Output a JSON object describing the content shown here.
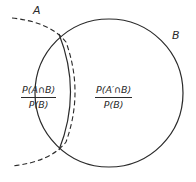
{
  "diagram": {
    "type": "venn",
    "sets": [
      {
        "name": "A",
        "label": "A",
        "style": "dashed",
        "partially_shown": true
      },
      {
        "name": "B",
        "label": "B",
        "style": "solid"
      }
    ],
    "regions": [
      {
        "id": "A_and_B",
        "numerator": "P(A∩B)",
        "denominator": "P(B)"
      },
      {
        "id": "Acomp_and_B",
        "numerator": "P(A′∩B)",
        "denominator": "P(B)"
      }
    ],
    "colors": {
      "stroke": "#2a2a2a",
      "background": "#ffffff"
    }
  }
}
